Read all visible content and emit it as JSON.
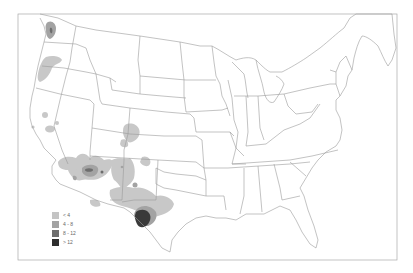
{
  "map": {
    "type": "choropleth",
    "region": "Contiguous United States",
    "background": "#ffffff",
    "border_color": "#9a9a9a",
    "frame_color": "#a0a0a0"
  },
  "legend": {
    "items": [
      {
        "label": "< 4",
        "color": "#c4c4c4"
      },
      {
        "label": "4 - 8",
        "color": "#a3a3a3"
      },
      {
        "label": "8 - 12",
        "color": "#6e6e6e"
      },
      {
        "label": "> 12",
        "color": "#2e2e2e"
      }
    ]
  },
  "shaded_regions": [
    {
      "area": "Puget Sound, Washington",
      "class": "4 - 8"
    },
    {
      "area": "Northwest Oregon coast",
      "class": "< 4"
    },
    {
      "area": "Central California",
      "class": "< 4"
    },
    {
      "area": "Western Colorado",
      "class": "< 4"
    },
    {
      "area": "Southern California / Arizona",
      "class": "< 4"
    },
    {
      "area": "Central Arizona",
      "class": "8 - 12"
    },
    {
      "area": "New Mexico",
      "class": "< 4"
    },
    {
      "area": "West Texas",
      "class": "4 - 8"
    },
    {
      "area": "Big Bend, Texas",
      "class": "> 12"
    }
  ]
}
